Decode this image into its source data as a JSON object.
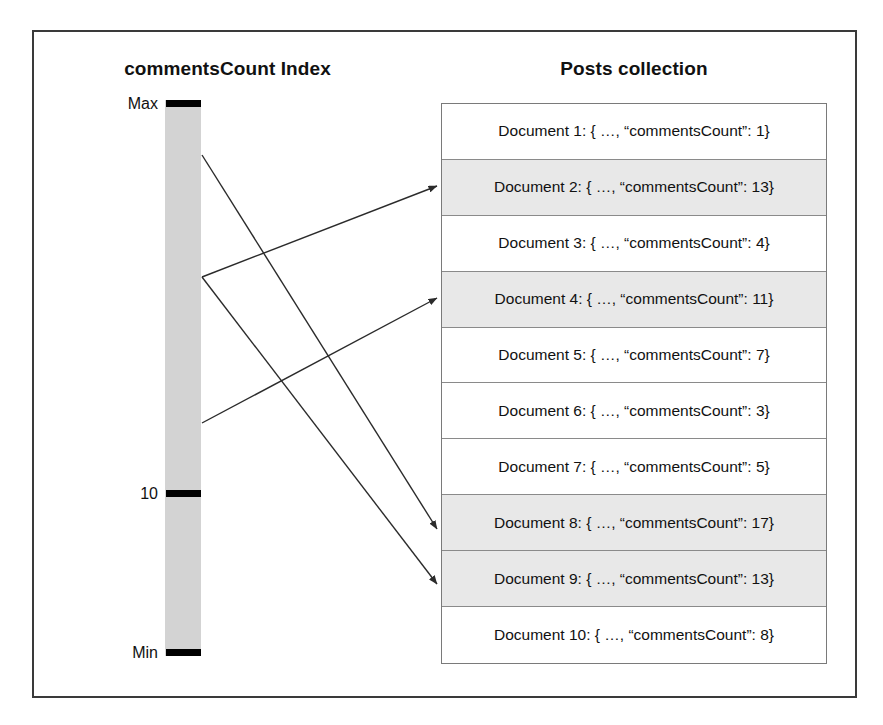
{
  "diagram": {
    "index_panel": {
      "title": "commentsCount Index",
      "bar_color": "#d3d3d3",
      "ticks": [
        {
          "label": "Max",
          "position_pct": 0.6
        },
        {
          "label": "10",
          "position_pct": 70.7
        },
        {
          "label": "Min",
          "position_pct": 98.6
        }
      ]
    },
    "collection_panel": {
      "title": "Posts collection",
      "column_header": "",
      "shaded_color": "#e8e8e8",
      "documents": [
        {
          "label": "Document 1: { …, “commentsCount”: 1}",
          "name": "Document 1",
          "commentsCount": 1,
          "shaded": false
        },
        {
          "label": "Document 2: { …, “commentsCount”: 13}",
          "name": "Document 2",
          "commentsCount": 13,
          "shaded": true
        },
        {
          "label": "Document 3: { …, “commentsCount”: 4}",
          "name": "Document 3",
          "commentsCount": 4,
          "shaded": false
        },
        {
          "label": "Document 4: { …, “commentsCount”: 11}",
          "name": "Document 4",
          "commentsCount": 11,
          "shaded": true
        },
        {
          "label": "Document 5: { …, “commentsCount”: 7}",
          "name": "Document 5",
          "commentsCount": 7,
          "shaded": false
        },
        {
          "label": "Document 6: { …, “commentsCount”: 3}",
          "name": "Document 6",
          "commentsCount": 3,
          "shaded": false
        },
        {
          "label": "Document 7: { …, “commentsCount”: 5}",
          "name": "Document 7",
          "commentsCount": 5,
          "shaded": false
        },
        {
          "label": "Document 8: { …, “commentsCount”: 17}",
          "name": "Document 8",
          "commentsCount": 17,
          "shaded": true
        },
        {
          "label": "Document 9: { …, “commentsCount”: 13}",
          "name": "Document 9",
          "commentsCount": 13,
          "shaded": true
        },
        {
          "label": "Document 10: { …, “commentsCount”: 8}",
          "name": "Document 10",
          "commentsCount": 8,
          "shaded": false
        }
      ]
    },
    "pointers": [
      {
        "from_index_y": 155,
        "to_document": 8,
        "name": "pointer-to-document-8"
      },
      {
        "from_index_y": 277,
        "to_document": 2,
        "name": "pointer-to-document-2"
      },
      {
        "from_index_y": 277,
        "to_document": 9,
        "name": "pointer-to-document-9"
      },
      {
        "from_index_y": 423,
        "to_document": 4,
        "name": "pointer-to-document-4"
      }
    ]
  }
}
